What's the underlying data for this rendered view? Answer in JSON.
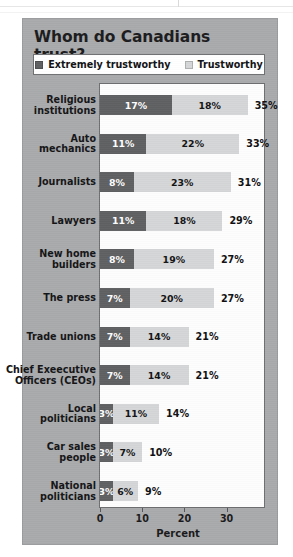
{
  "chart_data": {
    "type": "bar",
    "orientation": "horizontal",
    "stacked": true,
    "title": "Whom do Canadians trust?",
    "xlabel": "Percent",
    "ylabel": "",
    "xlim": [
      0,
      39
    ],
    "xticks": [
      0,
      10,
      20,
      30
    ],
    "xtick_labels": [
      "0",
      "10",
      "20",
      "30"
    ],
    "grid": false,
    "legend_position": "top",
    "categories": [
      "Religious institutions",
      "Auto mechanics",
      "Journalists",
      "Lawyers",
      "New home builders",
      "The press",
      "Trade unions",
      "Chief Exeecutive Officers (CEOs)",
      "Local politicians",
      "Car sales people",
      "National politicians"
    ],
    "series": [
      {
        "name": "Extremely trustworthy",
        "color": "#5f6062",
        "values": [
          17,
          11,
          8,
          11,
          8,
          7,
          7,
          7,
          3,
          3,
          3
        ],
        "labels": [
          "17%",
          "11%",
          "8%",
          "11%",
          "8%",
          "7%",
          "7%",
          "7%",
          "3%",
          "3%",
          "3%"
        ]
      },
      {
        "name": "Trustworthy",
        "color": "#d5d6d7",
        "values": [
          18,
          22,
          23,
          18,
          19,
          20,
          14,
          14,
          11,
          7,
          6
        ],
        "labels": [
          "18%",
          "22%",
          "23%",
          "18%",
          "19%",
          "20%",
          "14%",
          "14%",
          "11%",
          "7%",
          "6%"
        ]
      }
    ],
    "totals": [
      35,
      33,
      31,
      29,
      27,
      27,
      21,
      21,
      14,
      10,
      9
    ],
    "total_labels": [
      "35%",
      "33%",
      "31%",
      "29%",
      "27%",
      "27%",
      "21%",
      "21%",
      "14%",
      "10%",
      "9%"
    ]
  },
  "rows": [
    {
      "label_line1": "Religious",
      "label_line2": "institutions",
      "dark": 17,
      "light": 18,
      "dark_label": "17%",
      "light_label": "18%",
      "total_label": "35%"
    },
    {
      "label_line1": "Auto",
      "label_line2": "mechanics",
      "dark": 11,
      "light": 22,
      "dark_label": "11%",
      "light_label": "22%",
      "total_label": "33%"
    },
    {
      "label_line1": "Journalists",
      "label_line2": "",
      "dark": 8,
      "light": 23,
      "dark_label": "8%",
      "light_label": "23%",
      "total_label": "31%"
    },
    {
      "label_line1": "Lawyers",
      "label_line2": "",
      "dark": 11,
      "light": 18,
      "dark_label": "11%",
      "light_label": "18%",
      "total_label": "29%"
    },
    {
      "label_line1": "New home",
      "label_line2": "builders",
      "dark": 8,
      "light": 19,
      "dark_label": "8%",
      "light_label": "19%",
      "total_label": "27%"
    },
    {
      "label_line1": "The press",
      "label_line2": "",
      "dark": 7,
      "light": 20,
      "dark_label": "7%",
      "light_label": "20%",
      "total_label": "27%"
    },
    {
      "label_line1": "Trade unions",
      "label_line2": "",
      "dark": 7,
      "light": 14,
      "dark_label": "7%",
      "light_label": "14%",
      "total_label": "21%"
    },
    {
      "label_line1": "Chief Exeecutive",
      "label_line2": "Officers (CEOs)",
      "dark": 7,
      "light": 14,
      "dark_label": "7%",
      "light_label": "14%",
      "total_label": "21%"
    },
    {
      "label_line1": "Local",
      "label_line2": "politicians",
      "dark": 3,
      "light": 11,
      "dark_label": "3%",
      "light_label": "11%",
      "total_label": "14%"
    },
    {
      "label_line1": "Car sales",
      "label_line2": "people",
      "dark": 3,
      "light": 7,
      "dark_label": "3%",
      "light_label": "7%",
      "total_label": "10%"
    },
    {
      "label_line1": "National",
      "label_line2": "politicians",
      "dark": 3,
      "light": 6,
      "dark_label": "3%",
      "light_label": "6%",
      "total_label": "9%"
    }
  ],
  "legend": {
    "items": [
      {
        "label": "Extremely trustworthy",
        "color": "#5f6062"
      },
      {
        "label": "Trustworthy",
        "color": "#d5d6d7"
      }
    ]
  },
  "axis": {
    "ticks": [
      "0",
      "10",
      "20",
      "30"
    ],
    "title": "Percent"
  },
  "colors": {
    "panel": "#a9aaac",
    "plot": "#fdfdfd",
    "dark_bar": "#5f6062",
    "light_bar": "#d5d6d7",
    "frame": "#6e6f71",
    "text": "#141416"
  }
}
